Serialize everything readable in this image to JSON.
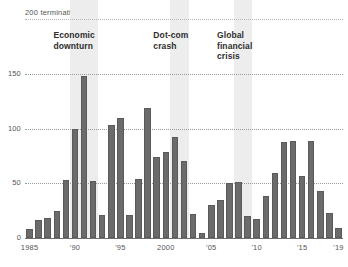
{
  "chart_data": {
    "type": "bar",
    "title": "",
    "top_axis_label": "200 terminations",
    "xlabel": "",
    "ylabel": "terminations",
    "ylim": [
      0,
      200
    ],
    "grid": true,
    "gridlines": [
      200,
      150,
      100,
      50,
      0
    ],
    "ytick_labels": [
      "150",
      "100",
      "50",
      "0"
    ],
    "ytick_values": [
      150,
      100,
      50,
      0
    ],
    "legend": "none",
    "bar_color": "#6b6b6b",
    "band_color": "#ededed",
    "categories": [
      1985,
      1986,
      1987,
      1988,
      1989,
      1990,
      1991,
      1992,
      1993,
      1994,
      1995,
      1996,
      1997,
      1998,
      1999,
      2000,
      2001,
      2002,
      2003,
      2004,
      2005,
      2006,
      2007,
      2008,
      2009,
      2010,
      2011,
      2012,
      2013,
      2014,
      2015,
      2016,
      2017,
      2018,
      2019
    ],
    "values": [
      8,
      16,
      18,
      25,
      53,
      100,
      148,
      52,
      21,
      103,
      110,
      21,
      54,
      119,
      74,
      79,
      92,
      70,
      22,
      5,
      30,
      35,
      50,
      51,
      20,
      17,
      38,
      59,
      88,
      89,
      57,
      89,
      43,
      23,
      9
    ],
    "xtick_labels": [
      "1985",
      "'90",
      "'95",
      "2000",
      "'05",
      "'10",
      "'15",
      "'19"
    ],
    "xtick_years": [
      1985,
      1990,
      1995,
      2000,
      2005,
      2010,
      2015,
      2019
    ],
    "annotations": [
      {
        "text": "Economic\ndownturn",
        "start_year": 1990,
        "end_year": 1992
      },
      {
        "text": "Dot-com\ncrash",
        "start_year": 2001,
        "end_year": 2002
      },
      {
        "text": "Global\nfinancial\ncrisis",
        "start_year": 2008,
        "end_year": 2009
      }
    ]
  }
}
